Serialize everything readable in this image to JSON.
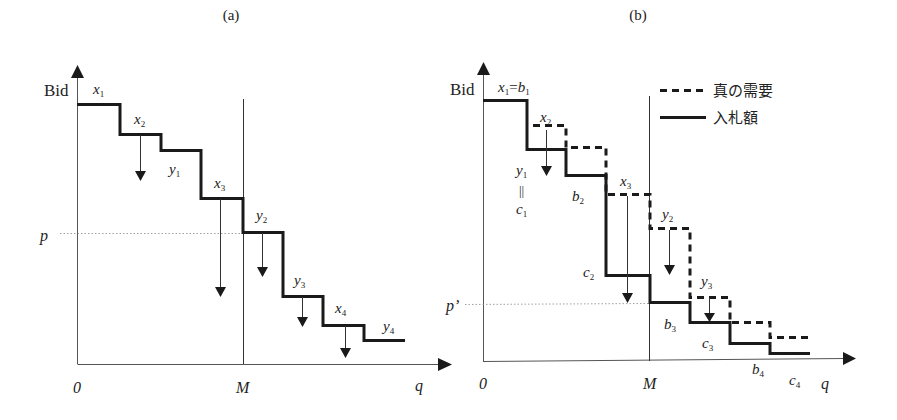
{
  "panels": [
    {
      "id": "a",
      "title": "(a)",
      "y_axis_label": "Bid",
      "x_axis_label": "q",
      "origin_label": "0",
      "m_label": "M",
      "price_label": "p",
      "labels": {
        "x1": {
          "base": "x",
          "sub": "1"
        },
        "x2": {
          "base": "x",
          "sub": "2"
        },
        "y1": {
          "base": "y",
          "sub": "1"
        },
        "x3": {
          "base": "x",
          "sub": "3"
        },
        "y2": {
          "base": "y",
          "sub": "2"
        },
        "y3": {
          "base": "y",
          "sub": "3"
        },
        "x4": {
          "base": "x",
          "sub": "4"
        },
        "y4": {
          "base": "y",
          "sub": "4"
        }
      }
    },
    {
      "id": "b",
      "title": "(b)",
      "y_axis_label": "Bid",
      "x_axis_label": "q",
      "origin_label": "0",
      "m_label": "M",
      "price_label": "p’",
      "legend": {
        "dashed": "真の需要",
        "solid": "入札額"
      },
      "labels": {
        "x1": {
          "base": "x",
          "sub": "1"
        },
        "eq": "=",
        "b1": {
          "base": "b",
          "sub": "1"
        },
        "x2": {
          "base": "x",
          "sub": "2"
        },
        "y1": {
          "base": "y",
          "sub": "1"
        },
        "parallel": "||",
        "c1": {
          "base": "c",
          "sub": "1"
        },
        "b2": {
          "base": "b",
          "sub": "2"
        },
        "x3": {
          "base": "x",
          "sub": "3"
        },
        "c2": {
          "base": "c",
          "sub": "2"
        },
        "y2": {
          "base": "y",
          "sub": "2"
        },
        "y3": {
          "base": "y",
          "sub": "3"
        },
        "b3": {
          "base": "b",
          "sub": "3"
        },
        "c3": {
          "base": "c",
          "sub": "3"
        },
        "b4": {
          "base": "b",
          "sub": "4"
        },
        "c4": {
          "base": "c",
          "sub": "4"
        }
      }
    }
  ],
  "colors": {
    "line": "#1a1a1a",
    "axis": "#555555",
    "dotted": "#777777"
  }
}
